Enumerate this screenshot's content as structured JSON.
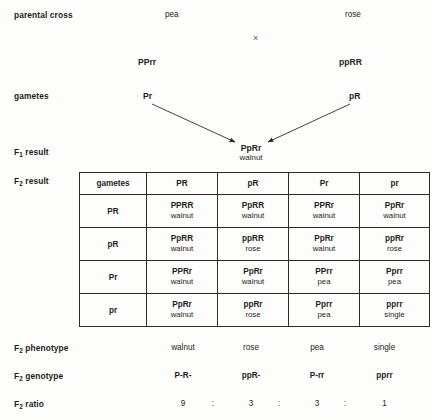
{
  "diagram": {
    "stages": [
      {
        "label": "parental cross",
        "sub": ""
      },
      {
        "label": "gametes",
        "sub": ""
      },
      {
        "label": "F",
        "sub": "1",
        "tail": " result"
      },
      {
        "label": "F",
        "sub": "2",
        "tail": " result"
      },
      {
        "label": "F",
        "sub": "2",
        "tail": " phenotype"
      },
      {
        "label": "F",
        "sub": "2",
        "tail": " genotype"
      },
      {
        "label": "F",
        "sub": "2",
        "tail": " ratio"
      }
    ]
  },
  "parental": {
    "left_phenotype": "pea",
    "right_phenotype": "rose",
    "cross_symbol": "×",
    "left_genotype": "PPrr",
    "right_genotype": "ppRR"
  },
  "gametes": {
    "left": "Pr",
    "right": "pR"
  },
  "f1": {
    "genotype": "PpRr",
    "phenotype": "walnut"
  },
  "punnett": {
    "corner_label": "gametes",
    "column_gametes": [
      "PR",
      "pR",
      "Pr",
      "pr"
    ],
    "row_gametes": [
      "PR",
      "pR",
      "Pr",
      "pr"
    ],
    "cells": [
      [
        {
          "genotype": "PPRR",
          "phenotype": "walnut"
        },
        {
          "genotype": "PpRR",
          "phenotype": "walnut"
        },
        {
          "genotype": "PPRr",
          "phenotype": "walnut"
        },
        {
          "genotype": "PpRr",
          "phenotype": "walnut"
        }
      ],
      [
        {
          "genotype": "PpRR",
          "phenotype": "walnut"
        },
        {
          "genotype": "ppRR",
          "phenotype": "rose"
        },
        {
          "genotype": "PpRr",
          "phenotype": "walnut"
        },
        {
          "genotype": "ppRr",
          "phenotype": "rose"
        }
      ],
      [
        {
          "genotype": "PPRr",
          "phenotype": "walnut"
        },
        {
          "genotype": "PpRr",
          "phenotype": "walnut"
        },
        {
          "genotype": "PPrr",
          "phenotype": "pea"
        },
        {
          "genotype": "Pprr",
          "phenotype": "pea"
        }
      ],
      [
        {
          "genotype": "PpRr",
          "phenotype": "walnut"
        },
        {
          "genotype": "ppRr",
          "phenotype": "rose"
        },
        {
          "genotype": "Pprr",
          "phenotype": "pea"
        },
        {
          "genotype": "pprr",
          "phenotype": "single"
        }
      ]
    ]
  },
  "summary": {
    "phenotypes": [
      "walnut",
      "rose",
      "pea",
      "single"
    ],
    "genotypes": [
      "P-R-",
      "ppR-",
      "P-rr",
      "pprr"
    ],
    "ratio_values": [
      "9",
      "3",
      "3",
      "1"
    ],
    "ratio_separator": ":"
  },
  "colors": {
    "background": "#fdfdfc",
    "text": "#1d1d1b",
    "border": "#2b2b2b",
    "arrow": "#2b2b2b"
  }
}
